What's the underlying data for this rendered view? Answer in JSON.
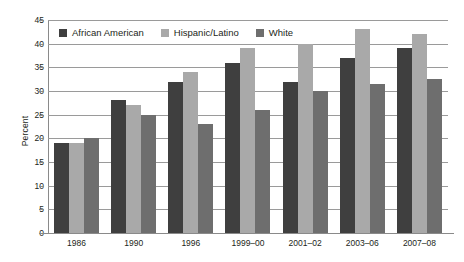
{
  "chart_data": {
    "type": "bar",
    "title": "",
    "xlabel": "",
    "ylabel": "Percent",
    "ylim": [
      0,
      45
    ],
    "ytick_step": 5,
    "yticks": [
      0,
      5,
      10,
      15,
      20,
      25,
      30,
      35,
      40,
      45
    ],
    "grid": true,
    "legend_position": "top-left",
    "categories": [
      "1986",
      "1990",
      "1996",
      "1999–00",
      "2001–02",
      "2003–06",
      "2007–08"
    ],
    "series": [
      {
        "name": "African American",
        "color": "#3f3f3f",
        "values": [
          19,
          28,
          32,
          36,
          32,
          37,
          39
        ]
      },
      {
        "name": "Hispanic/Latino",
        "color": "#a9a9a9",
        "values": [
          19,
          27,
          34,
          39,
          40,
          43,
          42
        ]
      },
      {
        "name": "White",
        "color": "#6e6e6e",
        "values": [
          20,
          25,
          23,
          26,
          30,
          31.5,
          32.5
        ]
      }
    ]
  },
  "axis": {
    "y_title": "Percent"
  }
}
